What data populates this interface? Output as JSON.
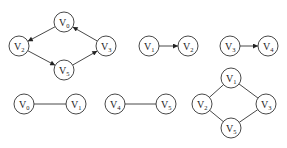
{
  "diagram": {
    "type": "graphs",
    "node_radius": 10,
    "colors": {
      "stroke": "#333333",
      "fill": "#ffffff",
      "text": "#222222"
    },
    "graphs": [
      {
        "id": "g1",
        "directed": true,
        "nodes": [
          {
            "id": "a",
            "label": "V",
            "sub": "0",
            "x": 64,
            "y": 22
          },
          {
            "id": "b",
            "label": "V",
            "sub": "2",
            "x": 19,
            "y": 46
          },
          {
            "id": "c",
            "label": "V",
            "sub": "3",
            "x": 106,
            "y": 46
          },
          {
            "id": "d",
            "label": "V",
            "sub": "5",
            "x": 64,
            "y": 70
          }
        ],
        "edges": [
          [
            "a",
            "b"
          ],
          [
            "b",
            "d"
          ],
          [
            "d",
            "c"
          ],
          [
            "c",
            "a"
          ]
        ]
      },
      {
        "id": "g2",
        "directed": true,
        "nodes": [
          {
            "id": "a",
            "label": "V",
            "sub": "1",
            "x": 149,
            "y": 46
          },
          {
            "id": "b",
            "label": "V",
            "sub": "2",
            "x": 188,
            "y": 46
          }
        ],
        "edges": [
          [
            "a",
            "b"
          ]
        ]
      },
      {
        "id": "g3",
        "directed": true,
        "nodes": [
          {
            "id": "a",
            "label": "V",
            "sub": "3",
            "x": 230,
            "y": 46
          },
          {
            "id": "b",
            "label": "V",
            "sub": "4",
            "x": 268,
            "y": 46
          }
        ],
        "edges": [
          [
            "a",
            "b"
          ]
        ]
      },
      {
        "id": "g4",
        "directed": false,
        "nodes": [
          {
            "id": "a",
            "label": "V",
            "sub": "0",
            "x": 24,
            "y": 104
          },
          {
            "id": "b",
            "label": "V",
            "sub": "1",
            "x": 76,
            "y": 104
          }
        ],
        "edges": [
          [
            "a",
            "b"
          ]
        ]
      },
      {
        "id": "g5",
        "directed": false,
        "nodes": [
          {
            "id": "a",
            "label": "V",
            "sub": "4",
            "x": 115,
            "y": 104
          },
          {
            "id": "b",
            "label": "V",
            "sub": "5",
            "x": 166,
            "y": 104
          }
        ],
        "edges": [
          [
            "a",
            "b"
          ]
        ]
      },
      {
        "id": "g6",
        "directed": false,
        "nodes": [
          {
            "id": "a",
            "label": "V",
            "sub": "1",
            "x": 231,
            "y": 78
          },
          {
            "id": "b",
            "label": "V",
            "sub": "2",
            "x": 202,
            "y": 104
          },
          {
            "id": "c",
            "label": "V",
            "sub": "3",
            "x": 266,
            "y": 104
          },
          {
            "id": "d",
            "label": "V",
            "sub": "5",
            "x": 231,
            "y": 128
          }
        ],
        "edges": [
          [
            "a",
            "b"
          ],
          [
            "a",
            "c"
          ],
          [
            "b",
            "d"
          ],
          [
            "c",
            "d"
          ]
        ]
      }
    ]
  }
}
